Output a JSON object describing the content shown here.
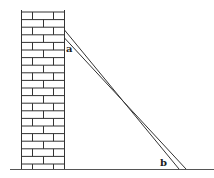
{
  "diagram": {
    "labels": {
      "top_contact": "a",
      "bottom_contact": "b"
    },
    "colors": {
      "line": "#333333",
      "background": "#ffffff"
    }
  }
}
